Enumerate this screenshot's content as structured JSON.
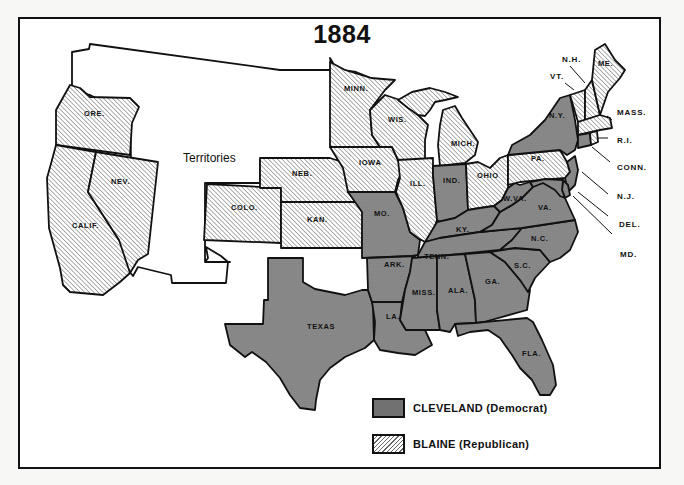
{
  "title": "1884",
  "territories_label": "Territories",
  "colors": {
    "democrat_fill": "#8a8a8a",
    "republican_hatch": "#666666",
    "border": "#111111",
    "background": "#ffffff"
  },
  "legend": [
    {
      "candidate": "CLEVELAND",
      "party": "(Democrat)",
      "pattern": "dotted-gray"
    },
    {
      "candidate": "BLAINE",
      "party": "(Republican)",
      "pattern": "diagonal-hatch"
    }
  ],
  "states": {
    "ore": "ORE.",
    "calif": "CALIF.",
    "nev": "NEV.",
    "colo": "COLO.",
    "neb": "NEB.",
    "kan": "KAN.",
    "texas": "TEXAS",
    "minn": "MINN.",
    "iowa": "IOWA",
    "mo": "MO.",
    "ark": "ARK.",
    "la": "LA.",
    "wis": "WIS.",
    "ill": "ILL.",
    "mich": "MICH.",
    "ind": "IND.",
    "ohio": "OHIO",
    "ky": "KY.",
    "tenn": "TENN.",
    "miss": "MISS.",
    "ala": "ALA.",
    "ga": "GA.",
    "fla": "FLA.",
    "sc": "S.C.",
    "nc": "N.C.",
    "va": "VA.",
    "wva": "W.VA.",
    "pa": "PA.",
    "ny": "N.Y.",
    "me": "ME.",
    "nh": "N.H.",
    "vt": "VT.",
    "mass": "MASS.",
    "ri": "R.I.",
    "conn": "CONN.",
    "nj": "N.J.",
    "del": "DEL.",
    "md": "MD."
  },
  "results": {
    "democrat": [
      "TEXAS",
      "MO.",
      "ARK.",
      "LA.",
      "IND.",
      "KY.",
      "TENN.",
      "MISS.",
      "ALA.",
      "GA.",
      "FLA.",
      "S.C.",
      "N.C.",
      "VA.",
      "W.VA.",
      "N.Y.",
      "CONN.",
      "N.J.",
      "DEL.",
      "MD."
    ],
    "republican": [
      "ORE.",
      "CALIF.",
      "NEV.",
      "COLO.",
      "NEB.",
      "KAN.",
      "MINN.",
      "IOWA",
      "WIS.",
      "ILL.",
      "MICH.",
      "OHIO",
      "PA.",
      "ME.",
      "N.H.",
      "VT.",
      "MASS.",
      "R.I."
    ]
  }
}
